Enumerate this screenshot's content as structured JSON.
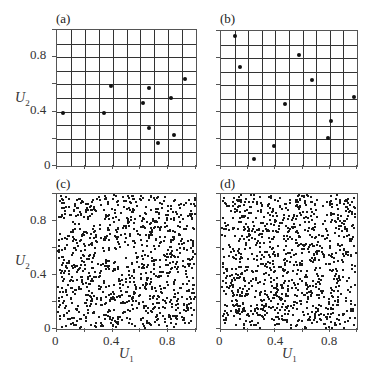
{
  "figure": {
    "panels": [
      {
        "id": "a",
        "label": "(a)",
        "type": "grid-scatter"
      },
      {
        "id": "b",
        "label": "(b)",
        "type": "grid-scatter"
      },
      {
        "id": "c",
        "label": "(c)",
        "type": "dense-scatter"
      },
      {
        "id": "d",
        "label": "(d)",
        "type": "dense-scatter"
      }
    ],
    "y_ticks": [
      "0",
      "0.4",
      "0.8"
    ],
    "x_ticks": [
      "0",
      "0.4",
      "0.8"
    ],
    "xlabel": "U",
    "xlabel_sub": "1",
    "ylabel": "U",
    "ylabel_sub": "2"
  },
  "chart_data": [
    {
      "panel": "(a)",
      "type": "scatter",
      "xlabel": "",
      "ylabel": "U2",
      "xlim": [
        0,
        1
      ],
      "ylim": [
        0,
        1
      ],
      "grid": true,
      "grid_divisions": 10,
      "x": [
        0.04,
        0.34,
        0.39,
        0.62,
        0.66,
        0.66,
        0.73,
        0.82,
        0.84,
        0.92
      ],
      "y": [
        0.39,
        0.39,
        0.59,
        0.46,
        0.57,
        0.28,
        0.17,
        0.5,
        0.23,
        0.64
      ]
    },
    {
      "panel": "(b)",
      "type": "scatter",
      "xlabel": "",
      "ylabel": "",
      "xlim": [
        0,
        1
      ],
      "ylim": [
        0,
        1
      ],
      "grid": true,
      "grid_divisions": 10,
      "x": [
        0.1,
        0.14,
        0.24,
        0.39,
        0.47,
        0.57,
        0.67,
        0.81,
        0.79,
        0.98
      ],
      "y": [
        0.96,
        0.73,
        0.05,
        0.15,
        0.46,
        0.82,
        0.64,
        0.33,
        0.21,
        0.51
      ]
    },
    {
      "panel": "(c)",
      "type": "scatter",
      "xlabel": "U1",
      "ylabel": "U2",
      "xlim": [
        0,
        1
      ],
      "ylim": [
        0,
        1
      ],
      "grid": false,
      "n_points": 1000,
      "distribution": "uniform random on unit square",
      "seed": 17
    },
    {
      "panel": "(d)",
      "type": "scatter",
      "xlabel": "U1",
      "ylabel": "",
      "xlim": [
        0,
        1
      ],
      "ylim": [
        0,
        1
      ],
      "grid": false,
      "n_points": 1000,
      "distribution": "uniform random on unit square",
      "seed": 91
    }
  ]
}
